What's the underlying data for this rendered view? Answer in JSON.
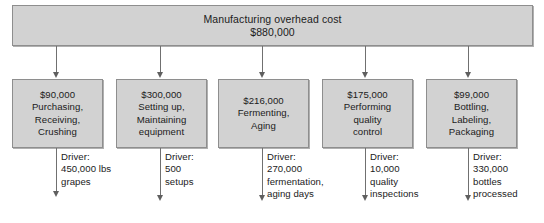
{
  "diagram": {
    "top_box": {
      "label": "Manufacturing overhead cost",
      "amount": "$880,000"
    },
    "driver_label": "Driver:",
    "activities": [
      {
        "amount": "$90,000",
        "lines": [
          "Purchasing,",
          "Receiving,",
          "Crushing"
        ],
        "driver_lines": [
          "450,000 lbs",
          "grapes"
        ]
      },
      {
        "amount": "$300,000",
        "lines": [
          "Setting up,",
          "Maintaining",
          "equipment"
        ],
        "driver_lines": [
          "500",
          "setups"
        ]
      },
      {
        "amount": "$216,000",
        "lines": [
          "Fermenting,",
          "Aging"
        ],
        "driver_lines": [
          "270,000",
          "fermentation,",
          "aging days"
        ]
      },
      {
        "amount": "$175,000",
        "lines": [
          "Performing",
          "quality",
          "control"
        ],
        "driver_lines": [
          "10,000",
          "quality",
          "inspections"
        ]
      },
      {
        "amount": "$99,000",
        "lines": [
          "Bottling,",
          "Labeling,",
          "Packaging"
        ],
        "driver_lines": [
          "330,000",
          "bottles",
          "processed"
        ]
      }
    ],
    "colors": {
      "box_fill": "#d2d2d2",
      "box_border": "#8e8e8e",
      "connector": "#707070",
      "text": "#1b1b1b",
      "page_background": "#ffffff"
    }
  }
}
